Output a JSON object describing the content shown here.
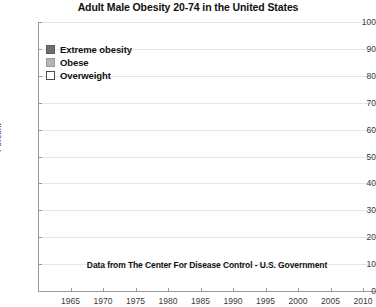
{
  "chart_data": {
    "type": "area",
    "title": "Adult Male Obesity 20-74 in the United States",
    "xlabel": "",
    "ylabel": "Percent",
    "ylim": [
      0,
      100
    ],
    "xlim": [
      1960,
      2012
    ],
    "grid": true,
    "stacked": true,
    "legend_position": "top-left",
    "x_ticks": [
      1965,
      1970,
      1975,
      1980,
      1985,
      1990,
      1995,
      2000,
      2005,
      2010
    ],
    "y_ticks": [
      0,
      10,
      20,
      30,
      40,
      50,
      60,
      70,
      80,
      90,
      100
    ],
    "x": [
      1960,
      1962,
      1965,
      1968,
      1971,
      1974,
      1976,
      1978,
      1980,
      1982,
      1985,
      1988,
      1990,
      1992,
      1994,
      1996,
      1999,
      2000,
      2002,
      2004,
      2006,
      2008,
      2010,
      2012
    ],
    "series": [
      {
        "name": "Overweight",
        "color": "#ffffff",
        "values": [
          39.9,
          39.8,
          39.7,
          39.6,
          39.9,
          40.3,
          40.5,
          40.4,
          40.3,
          40.2,
          40.1,
          39.9,
          39.7,
          39.5,
          39.4,
          39.3,
          39.1,
          38.9,
          38.7,
          39.6,
          38.6,
          38.8,
          39.2,
          39.4
        ]
      },
      {
        "name": "Obese",
        "color": "#b5b5b5",
        "values": [
          12.0,
          12.2,
          12.4,
          12.5,
          12.7,
          12.9,
          13.0,
          13.3,
          13.6,
          15.2,
          17.0,
          19.8,
          21.5,
          23.3,
          25.1,
          26.7,
          28.9,
          29.9,
          30.8,
          30.9,
          32.1,
          31.8,
          32.4,
          32.6
        ]
      },
      {
        "name": "Extreme obesity",
        "color": "#6e6e6e",
        "values": [
          0.3,
          0.3,
          0.3,
          0.4,
          0.4,
          0.5,
          0.5,
          0.6,
          0.7,
          0.9,
          1.1,
          1.4,
          1.7,
          2.0,
          2.3,
          2.6,
          3.0,
          3.2,
          3.5,
          3.7,
          4.2,
          4.4,
          4.0,
          4.6
        ]
      }
    ],
    "annotations": [
      {
        "name": "source-caption",
        "text": "Data from The Center For Disease Control - U.S. Government"
      }
    ]
  },
  "legend": {
    "items": [
      {
        "label": "Extreme obesity",
        "color": "#6e6e6e",
        "border": "#5a5a5a"
      },
      {
        "label": "Obese",
        "color": "#b5b5b5",
        "border": "#9a9a9a"
      },
      {
        "label": "Overweight",
        "color": "#ffffff",
        "border": "#4a4a4a"
      }
    ]
  },
  "axes": {
    "y_title": "Percent"
  },
  "colors": {
    "grid": "#e6e6e6",
    "axis": "#9a9a9a",
    "band_line": "#4a4a4a",
    "background": "#ffffff"
  }
}
